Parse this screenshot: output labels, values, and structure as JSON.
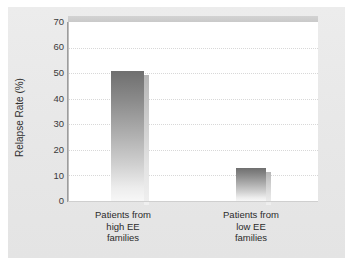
{
  "chart_data": {
    "type": "bar",
    "title": "",
    "xlabel": "",
    "ylabel": "Relapse Rate (%)",
    "categories": [
      "Patients from high EE families",
      "Patients from low EE families"
    ],
    "category_lines": [
      [
        "Patients from",
        "high EE",
        "families"
      ],
      [
        "Patients from",
        "low EE",
        "families"
      ]
    ],
    "values": [
      51,
      13
    ],
    "ylim": [
      0,
      70
    ],
    "yticks": [
      0,
      10,
      20,
      30,
      40,
      50,
      60,
      70
    ],
    "ytick_labels": [
      "0",
      "10",
      "20",
      "30",
      "40",
      "50",
      "60",
      "70"
    ],
    "grid": "horizontal-dotted",
    "legend": "none",
    "bar_fill": "#8a8a8a",
    "bar_gradient_top": "#6f6f6f",
    "bar_gradient_bottom": "#f7f7f7",
    "panel_color": "#e9e9e9",
    "plot_background": "#ffffff",
    "gridline_color": "#d8d8d8",
    "axis_color": "#9d9d9d",
    "text_color": "#2f2f2f"
  }
}
